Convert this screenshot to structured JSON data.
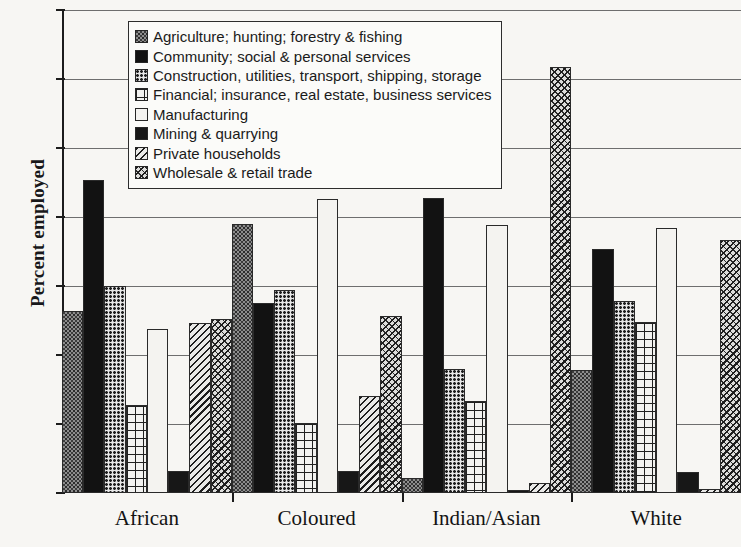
{
  "chart_data": {
    "type": "bar",
    "title": "",
    "subtitle": "",
    "xlabel": "",
    "ylabel": "Percent employed",
    "ylim": [
      0,
      35
    ],
    "ytick_step": 5,
    "yticks": [
      0,
      5,
      10,
      15,
      20,
      25,
      30,
      35
    ],
    "grid": true,
    "grid_axis": "y",
    "legend_position": "top-center",
    "categories": [
      "African",
      "Coloured",
      "Indian/Asian",
      "White"
    ],
    "series": [
      {
        "name": "Agriculture; hunting; forestry & fishing",
        "pattern": "dark-speckle",
        "values": [
          13.2,
          19.5,
          1.1,
          8.9
        ]
      },
      {
        "name": "Community; social & personal services",
        "pattern": "solid-black",
        "values": [
          22.7,
          13.8,
          21.4,
          17.7
        ]
      },
      {
        "name": "Construction, utilities, transport, shipping, storage",
        "pattern": "fine-dot-grid",
        "values": [
          15.0,
          14.7,
          9.0,
          13.9
        ]
      },
      {
        "name": "Financial; insurance, real estate, business services",
        "pattern": "cross-grid",
        "values": [
          6.4,
          5.1,
          6.7,
          12.4
        ]
      },
      {
        "name": "Manufacturing",
        "pattern": "white-empty",
        "values": [
          11.9,
          21.3,
          19.4,
          19.2
        ]
      },
      {
        "name": "Mining & quarrying",
        "pattern": "solid-black-small",
        "values": [
          1.6,
          1.6,
          0.2,
          1.5
        ]
      },
      {
        "name": "Private households",
        "pattern": "diagonal-hatch",
        "values": [
          12.3,
          7.0,
          0.7,
          0.3
        ]
      },
      {
        "name": "Wholesale & retail trade",
        "pattern": "cross-hatch",
        "values": [
          12.6,
          12.8,
          30.9,
          18.3
        ]
      }
    ]
  },
  "legend": {
    "items": [
      {
        "label": "Agriculture; hunting; forestry & fishing",
        "swatch": "dark-speckle-swatch"
      },
      {
        "label": "Community; social & personal services",
        "swatch": "solid-black-swatch"
      },
      {
        "label": "Construction, utilities, transport, shipping, storage",
        "swatch": "fine-dot-grid-swatch"
      },
      {
        "label": "Financial; insurance, real estate, business services",
        "swatch": "cross-grid-swatch"
      },
      {
        "label": "Manufacturing",
        "swatch": "white-empty-swatch"
      },
      {
        "label": "Mining & quarrying",
        "swatch": "solid-black-small-swatch"
      },
      {
        "label": "Private households",
        "swatch": "diagonal-hatch-swatch"
      },
      {
        "label": "Wholesale & retail trade",
        "swatch": "cross-hatch-swatch"
      }
    ]
  }
}
